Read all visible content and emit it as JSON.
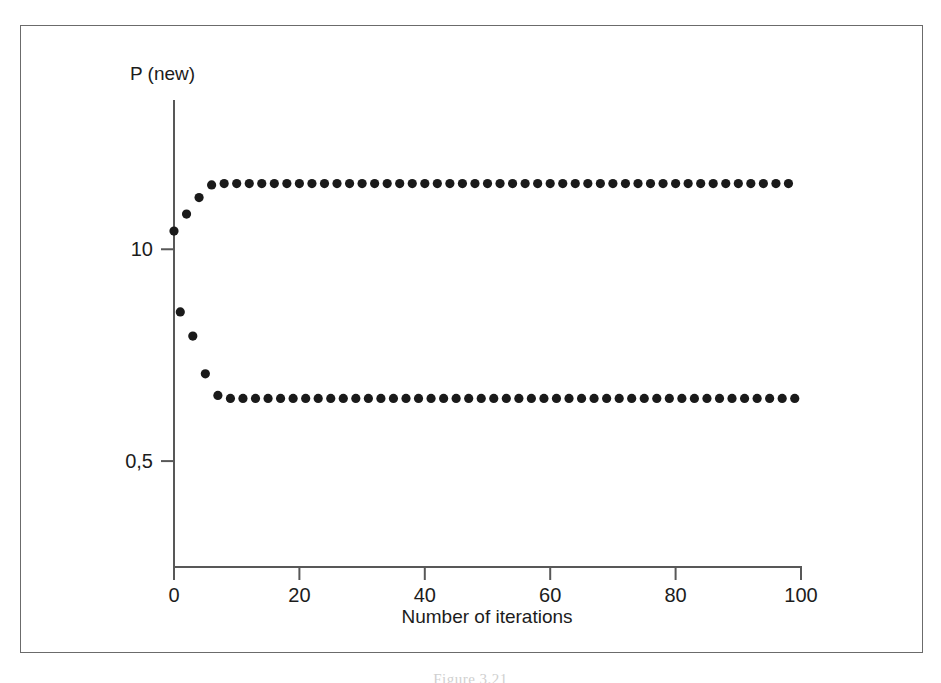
{
  "figure": {
    "caption": "Figure 3.21",
    "frame_color": "#6b6b6b",
    "background_color": "#ffffff"
  },
  "chart_data": {
    "type": "scatter",
    "title": "",
    "subtitle": "",
    "xlabel": "Number of iterations",
    "ylabel": "P (new)",
    "xlim": [
      0,
      100
    ],
    "ylim": [
      0.25,
      1.35
    ],
    "xticks": [
      0,
      20,
      40,
      60,
      80,
      100
    ],
    "xtick_labels": [
      "0",
      "20",
      "40",
      "60",
      "80",
      "100"
    ],
    "yticks": [
      1.0,
      0.5
    ],
    "ytick_labels": [
      "10",
      "0,5"
    ],
    "grid": false,
    "legend": null,
    "marker": "circle",
    "marker_color": "#1a1a1a",
    "marker_size_px": 4.6,
    "annotations": [],
    "upper_branch_value": 1.155,
    "lower_branch_value": 0.648,
    "series": [
      {
        "name": "P (new) vs iteration",
        "x": [
          0,
          1,
          2,
          3,
          4,
          5,
          6,
          7,
          8,
          9,
          10,
          11,
          12,
          13,
          14,
          15,
          16,
          17,
          18,
          19,
          20,
          21,
          22,
          23,
          24,
          25,
          26,
          27,
          28,
          29,
          30,
          31,
          32,
          33,
          34,
          35,
          36,
          37,
          38,
          39,
          40,
          41,
          42,
          43,
          44,
          45,
          46,
          47,
          48,
          49,
          50,
          51,
          52,
          53,
          54,
          55,
          56,
          57,
          58,
          59,
          60,
          61,
          62,
          63,
          64,
          65,
          66,
          67,
          68,
          69,
          70,
          71,
          72,
          73,
          74,
          75,
          76,
          77,
          78,
          79,
          80,
          81,
          82,
          83,
          84,
          85,
          86,
          87,
          88,
          89,
          90,
          91,
          92,
          93,
          94,
          95,
          96,
          97,
          98,
          99
        ],
        "y": [
          1.043,
          0.852,
          1.083,
          0.795,
          1.122,
          0.706,
          1.152,
          0.655,
          1.155,
          0.648,
          1.155,
          0.648,
          1.155,
          0.648,
          1.155,
          0.648,
          1.155,
          0.648,
          1.155,
          0.648,
          1.155,
          0.648,
          1.155,
          0.648,
          1.155,
          0.648,
          1.155,
          0.648,
          1.155,
          0.648,
          1.155,
          0.648,
          1.155,
          0.648,
          1.155,
          0.648,
          1.155,
          0.648,
          1.155,
          0.648,
          1.155,
          0.648,
          1.155,
          0.648,
          1.155,
          0.648,
          1.155,
          0.648,
          1.155,
          0.648,
          1.155,
          0.648,
          1.155,
          0.648,
          1.155,
          0.648,
          1.155,
          0.648,
          1.155,
          0.648,
          1.155,
          0.648,
          1.155,
          0.648,
          1.155,
          0.648,
          1.155,
          0.648,
          1.155,
          0.648,
          1.155,
          0.648,
          1.155,
          0.648,
          1.155,
          0.648,
          1.155,
          0.648,
          1.155,
          0.648,
          1.155,
          0.648,
          1.155,
          0.648,
          1.155,
          0.648,
          1.155,
          0.648,
          1.155,
          0.648,
          1.155,
          0.648,
          1.155,
          0.648,
          1.155,
          0.648,
          1.155,
          0.648,
          1.155,
          0.648
        ]
      }
    ]
  }
}
